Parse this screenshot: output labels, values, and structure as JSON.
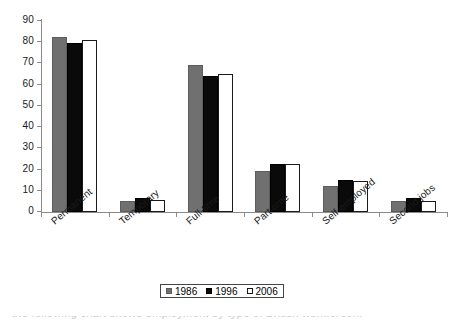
{
  "chart_data": {
    "type": "bar",
    "title": "",
    "subtitle": "",
    "xlabel": "",
    "ylabel": "",
    "ylim": [
      0,
      90
    ],
    "ytick_step": 10,
    "yticks": [
      90,
      80,
      70,
      60,
      50,
      40,
      30,
      20,
      10,
      0
    ],
    "grid": false,
    "legend_position": "bottom-center",
    "categories": [
      "Permanent",
      "Temporary",
      "Full-time",
      "Part-time",
      "Self-employed",
      "Second jobs"
    ],
    "series": [
      {
        "name": "1986",
        "color": "#707070",
        "values": [
          82.3,
          5.3,
          69.2,
          19.4,
          12.4,
          5.1
        ]
      },
      {
        "name": "1996",
        "color": "#0a0a0a",
        "values": [
          79.5,
          6.7,
          64.2,
          22.5,
          15.0,
          6.8
        ]
      },
      {
        "name": "2006",
        "color": "#ffffff",
        "values": [
          81.2,
          5.7,
          64.8,
          22.7,
          14.4,
          5.0
        ]
      }
    ]
  },
  "legend": {
    "entries": [
      {
        "label": "1986",
        "swatch": "legend-swatch-1986"
      },
      {
        "label": "1996",
        "swatch": "legend-swatch-1996"
      },
      {
        "label": "2006",
        "swatch": "legend-swatch-2006"
      }
    ]
  },
  "caption": {
    "clipped_text": "the following chart shows employment by type of British workforce..."
  }
}
